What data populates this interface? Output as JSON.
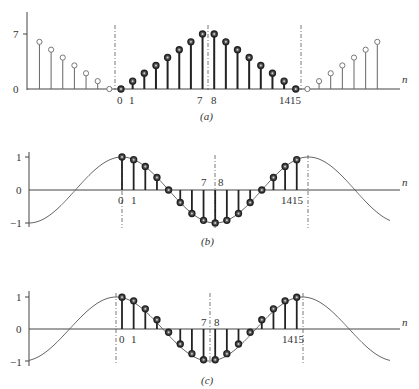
{
  "panels": [
    {
      "id": "a",
      "caption": "(a)",
      "y_ticks": [
        "7",
        "0"
      ],
      "x_labels": [
        "0",
        "1",
        "7",
        "8",
        "1415"
      ],
      "axis_label": "n",
      "description": "Sequence x(n) shown over 0..15 (filled stems) with its periodic extension (open circles) on both sides"
    },
    {
      "id": "b",
      "caption": "(b)",
      "y_ticks": [
        "1",
        "0",
        "-1"
      ],
      "x_labels": [
        "0",
        "1",
        "7",
        "8",
        "1415"
      ],
      "axis_label": "n",
      "description": "Cosine samples over n = 0..15 with continuous cosine envelope, period 16"
    },
    {
      "id": "c",
      "caption": "(c)",
      "y_ticks": [
        "1",
        "0",
        "-1"
      ],
      "x_labels": [
        "0",
        "1",
        "7",
        "8",
        "1415"
      ],
      "axis_label": "n",
      "description": "Half-sample shifted cosine samples over n = 0..15 with continuous cosine envelope"
    }
  ],
  "chart_data": [
    {
      "type": "stem",
      "title": "(a)",
      "xlabel": "n",
      "ylabel": "",
      "ylim": [
        0,
        7
      ],
      "x": [
        0,
        1,
        2,
        3,
        4,
        5,
        6,
        7,
        8,
        9,
        10,
        11,
        12,
        13,
        14,
        15
      ],
      "values": [
        0,
        1,
        2,
        3,
        4,
        5,
        6,
        7,
        7,
        6,
        5,
        4,
        3,
        2,
        1,
        0
      ],
      "extension_left": [
        6,
        5,
        4,
        3,
        2,
        1,
        0
      ],
      "extension_right": [
        0,
        1,
        2,
        3,
        4,
        5,
        6
      ]
    },
    {
      "type": "stem",
      "title": "(b)",
      "xlabel": "n",
      "ylim": [
        -1,
        1
      ],
      "x": [
        0,
        1,
        2,
        3,
        4,
        5,
        6,
        7,
        8,
        9,
        10,
        11,
        12,
        13,
        14,
        15
      ],
      "values": [
        1.0,
        0.92,
        0.71,
        0.38,
        0.0,
        -0.38,
        -0.71,
        -0.92,
        -1.0,
        -0.92,
        -0.71,
        -0.38,
        0.0,
        0.38,
        0.71,
        0.92
      ]
    },
    {
      "type": "stem",
      "title": "(c)",
      "xlabel": "n",
      "ylim": [
        -1,
        1
      ],
      "x": [
        0,
        1,
        2,
        3,
        4,
        5,
        6,
        7,
        8,
        9,
        10,
        11,
        12,
        13,
        14,
        15
      ],
      "values": [
        0.99,
        0.88,
        0.63,
        0.29,
        -0.1,
        -0.47,
        -0.77,
        -0.96,
        -0.96,
        -0.77,
        -0.47,
        -0.1,
        0.29,
        0.63,
        0.88,
        0.99
      ]
    }
  ]
}
